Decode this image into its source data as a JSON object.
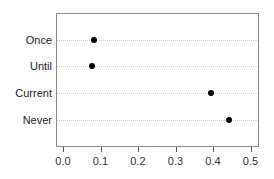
{
  "chart_data": {
    "type": "scatter",
    "subtype": "dot-plot",
    "title": "",
    "xlabel": "",
    "ylabel": "",
    "categories": [
      "Once",
      "Until",
      "Current",
      "Never"
    ],
    "values": [
      0.083,
      0.077,
      0.395,
      0.443
    ],
    "xlim": [
      0.0,
      0.5
    ],
    "x_ticks": [
      "0.0",
      "0.1",
      "0.2",
      "0.3",
      "0.4",
      "0.5"
    ],
    "grid": "horizontal dotted lines per category",
    "legend": null,
    "marker_color": "#000000"
  },
  "labels": {
    "cat0": "Once",
    "cat1": "Until",
    "cat2": "Current",
    "cat3": "Never",
    "tick0": "0.0",
    "tick1": "0.1",
    "tick2": "0.2",
    "tick3": "0.3",
    "tick4": "0.4",
    "tick5": "0.5"
  }
}
